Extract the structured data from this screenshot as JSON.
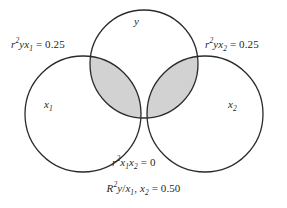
{
  "diagram": {
    "type": "venn",
    "background_color": "#ffffff",
    "stroke_color": "#2b2b2b",
    "shade_color": "#d2d2d2",
    "circles": [
      {
        "id": "y",
        "label": "y",
        "cx": 144,
        "cy": 64,
        "r": 54
      },
      {
        "id": "x1",
        "label": "x₁",
        "cx": 83,
        "cy": 114,
        "r": 58
      },
      {
        "id": "x2",
        "label": "x₂",
        "cx": 205,
        "cy": 114,
        "r": 58
      }
    ],
    "shaded_regions": [
      {
        "id": "y-x1-overlap",
        "between": [
          "y",
          "x1"
        ],
        "shaded": true
      },
      {
        "id": "y-x2-overlap",
        "between": [
          "y",
          "x2"
        ],
        "shaded": true
      }
    ],
    "set_labels": {
      "y": "y",
      "x1_base": "x",
      "x1_sub": "1",
      "x2_base": "x",
      "x2_sub": "2"
    },
    "annotations": {
      "r_y_x1": {
        "stat": "r",
        "exponent": "2",
        "vars_first": "yx",
        "vars_sub": "1",
        "operator": "=",
        "value": "0.25",
        "full_text": "r²yx₁ = 0.25"
      },
      "r_y_x2": {
        "stat": "r",
        "exponent": "2",
        "vars_first": "yx",
        "vars_sub": "2",
        "operator": "=",
        "value": "0.25",
        "full_text": "r²yx₂ = 0.25"
      },
      "r_x1_x2": {
        "stat": "r",
        "exponent": "2",
        "var_a": "x",
        "var_a_sub": "1",
        "var_b": "x",
        "var_b_sub": "2",
        "operator": "=",
        "value": "0",
        "full_text": "r²x₁x₂ = 0"
      },
      "R_y_x1x2": {
        "stat": "R",
        "exponent": "2",
        "dependent": "y",
        "slash": "/",
        "pred_a": "x",
        "pred_a_sub": "1",
        "separator": ", ",
        "pred_b": "x",
        "pred_b_sub": "2",
        "operator": "=",
        "value": "0.50",
        "full_text": "R²y/x₁, x₂ = 0.50"
      }
    }
  }
}
